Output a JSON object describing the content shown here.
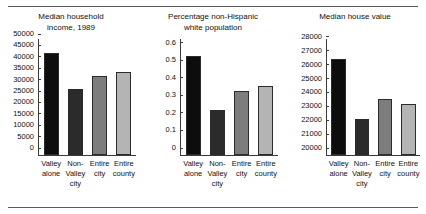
{
  "figure": {
    "has_top_rule": true,
    "has_bottom_rule": true,
    "background": "#ffffff"
  },
  "chart_data": [
    {
      "type": "bar",
      "title": "Median household\nincome, 1989",
      "xlabel": "",
      "ylabel": "",
      "categories": [
        "Valley\nalone",
        "Non-\nValley\ncity",
        "Entire\ncity",
        "Entire\ncounty"
      ],
      "values": [
        45000,
        29300,
        34800,
        36600
      ],
      "ylim": [
        0,
        50000
      ],
      "yticks": [
        0,
        5000,
        10000,
        15000,
        20000,
        25000,
        30000,
        35000,
        40000,
        45000,
        50000
      ],
      "ytick_labels": [
        "0",
        "5000",
        "10000",
        "15000",
        "20000",
        "25000",
        "30000",
        "35000",
        "40000",
        "45000",
        "50000"
      ],
      "bar_colors": [
        "#0d0d0d",
        "#2b2b2b",
        "#7d7d7d",
        "#b4b4b4"
      ],
      "bar_edge_color": "#2b2b2b",
      "grid": false,
      "legend": "none"
    },
    {
      "type": "bar",
      "title": "Percentage non-Hispanic\nwhite population",
      "xlabel": "",
      "ylabel": "",
      "categories": [
        "Valley\nalone",
        "Non-\nValley\ncity",
        "Entire\ncity",
        "Entire\ncounty"
      ],
      "values": [
        0.57,
        0.26,
        0.37,
        0.395
      ],
      "ylim": [
        0,
        0.65
      ],
      "yticks": [
        0,
        0.1,
        0.2,
        0.3,
        0.4,
        0.5,
        0.6
      ],
      "ytick_labels": [
        "0",
        "0.1",
        "0.2",
        "0.3",
        "0.4",
        "0.5",
        "0.6"
      ],
      "bar_colors": [
        "#0d0d0d",
        "#2b2b2b",
        "#7d7d7d",
        "#b4b4b4"
      ],
      "bar_edge_color": "#2b2b2b",
      "grid": false,
      "legend": "none"
    },
    {
      "type": "bar",
      "title": "Median house value",
      "xlabel": "",
      "ylabel": "",
      "categories": [
        "Valley\nalone",
        "Non-\nValley\ncity",
        "Entire\ncity",
        "Entire\ncounty"
      ],
      "values": [
        27000,
        22600,
        24100,
        23700
      ],
      "ylim": [
        20000,
        28200
      ],
      "yticks": [
        20000,
        21000,
        22000,
        23000,
        24000,
        25000,
        26000,
        27000,
        28000
      ],
      "ytick_labels": [
        "20000",
        "21000",
        "22000",
        "23000",
        "24000",
        "25000",
        "26000",
        "27000",
        "28000"
      ],
      "bar_colors": [
        "#0d0d0d",
        "#2b2b2b",
        "#7d7d7d",
        "#b4b4b4"
      ],
      "bar_edge_color": "#2b2b2b",
      "grid": false,
      "legend": "none"
    }
  ]
}
